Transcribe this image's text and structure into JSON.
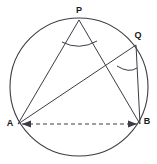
{
  "figure": {
    "kind": "circle-geometry-diagram",
    "width": 157,
    "height": 164,
    "background_color": "#ffffff",
    "stroke_color": "#3c3c46",
    "label_color": "#1a1a1a"
  },
  "circle": {
    "name": "circumcircle",
    "cx": 79,
    "cy": 87,
    "r": 69,
    "stroke_width": 1.1
  },
  "points": [
    {
      "id": "P",
      "label": "P",
      "x": 79,
      "y": 20,
      "label_x": 79,
      "label_y": 11
    },
    {
      "id": "Q",
      "label": "Q",
      "x": 136,
      "y": 45,
      "label_x": 138,
      "label_y": 36
    },
    {
      "id": "A",
      "label": "A",
      "x": 18,
      "y": 124,
      "label_x": 10,
      "label_y": 124
    },
    {
      "id": "B",
      "label": "B",
      "x": 140,
      "y": 124,
      "label_x": 147,
      "label_y": 122
    }
  ],
  "segments": [
    {
      "id": "PA",
      "from": "P",
      "to": "A",
      "style": "solid",
      "x1": 79,
      "y1": 20,
      "x2": 18,
      "y2": 124
    },
    {
      "id": "PB",
      "from": "P",
      "to": "B",
      "style": "solid",
      "x1": 79,
      "y1": 20,
      "x2": 140,
      "y2": 124
    },
    {
      "id": "QA",
      "from": "Q",
      "to": "A",
      "style": "solid",
      "x1": 136,
      "y1": 45,
      "x2": 18,
      "y2": 124
    },
    {
      "id": "QB",
      "from": "Q",
      "to": "B",
      "style": "solid",
      "x1": 136,
      "y1": 45,
      "x2": 140,
      "y2": 124
    },
    {
      "id": "AB",
      "from": "A",
      "to": "B",
      "style": "dashed",
      "x1": 22,
      "y1": 124,
      "x2": 137,
      "y2": 124,
      "dash_pattern": "4 3"
    }
  ],
  "angle_arcs": [
    {
      "id": "angle-at-P",
      "vertex": "P",
      "path": "M 62 42 Q 79 51 97 41"
    },
    {
      "id": "angle-at-Q",
      "vertex": "Q",
      "path": "M 117 66 Q 129 73 137 69"
    }
  ],
  "arrow_markers": [
    {
      "id": "arrow-A-end",
      "at": "A",
      "points": "22,124 31,120 31,128"
    },
    {
      "id": "arrow-B-end",
      "at": "B",
      "points": "137,124 128,120 128,128"
    }
  ]
}
